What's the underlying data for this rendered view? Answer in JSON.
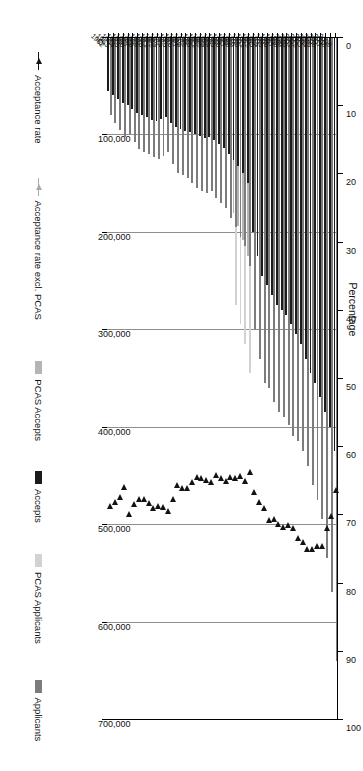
{
  "chart_data": {
    "type": "bar",
    "title": "",
    "orientation": "vertical-rotated-90",
    "xlabel": "",
    "ylabel_left": "",
    "percentage_axis_title": "Percentage",
    "count_axis_ticks": [
      "0",
      "100,000",
      "200,000",
      "300,000",
      "400,000",
      "500,000",
      "600,000",
      "700,000"
    ],
    "count_axis_values": [
      0,
      100000,
      200000,
      300000,
      400000,
      500000,
      600000,
      700000
    ],
    "count_axis_lim": [
      0,
      700000
    ],
    "percentage_axis_ticks": [
      "0",
      "10",
      "20",
      "30",
      "40",
      "50",
      "60",
      "70",
      "80",
      "90",
      "100"
    ],
    "percentage_axis_values": [
      0,
      10,
      20,
      30,
      40,
      50,
      60,
      70,
      80,
      90,
      100
    ],
    "percentage_axis_lim": [
      0,
      100
    ],
    "grid": true,
    "legend_position": "bottom",
    "categories": [
      "1962",
      "1963",
      "1964",
      "1965",
      "1966",
      "1967",
      "1968",
      "1969",
      "1970",
      "1971",
      "1972",
      "1973",
      "1974",
      "1975",
      "1976",
      "1977",
      "1978",
      "1979",
      "1980",
      "1981",
      "1982",
      "1983",
      "1984",
      "1985",
      "1986",
      "1987",
      "1988",
      "1989",
      "1990",
      "1991",
      "1992",
      "1993",
      "1994",
      "1995",
      "1996",
      "1997",
      "1998",
      "1999",
      "2000",
      "2001",
      "2002",
      "2003",
      "2004",
      "2005",
      "2006",
      "2007",
      "2008",
      "2009"
    ],
    "series": [
      {
        "name": "Applicants",
        "color": "#7c7c7c",
        "kind": "bar",
        "values": [
          80000,
          88000,
          95000,
          103000,
          100000,
          108000,
          115000,
          118000,
          120000,
          123000,
          125000,
          122000,
          118000,
          130000,
          140000,
          142000,
          145000,
          150000,
          155000,
          158000,
          160000,
          158000,
          165000,
          170000,
          175000,
          186000,
          195000,
          205000,
          215000,
          235000,
          300000,
          330000,
          355000,
          360000,
          375000,
          385000,
          390000,
          398000,
          410000,
          415000,
          425000,
          440000,
          460000,
          475000,
          495000,
          535000,
          570000,
          640000
        ]
      },
      {
        "name": "PCAS Applicants",
        "color": "#d2d2d2",
        "kind": "bar",
        "values": [
          0,
          0,
          0,
          0,
          0,
          0,
          0,
          0,
          0,
          0,
          0,
          0,
          0,
          0,
          0,
          0,
          0,
          0,
          0,
          0,
          0,
          0,
          0,
          0,
          0,
          0,
          80000,
          90000,
          100000,
          110000,
          0,
          0,
          0,
          0,
          0,
          0,
          0,
          0,
          0,
          0,
          0,
          0,
          0,
          0,
          0,
          0,
          0,
          0
        ]
      },
      {
        "name": "Accepts",
        "color": "#1b1b1b",
        "kind": "bar",
        "values": [
          55000,
          60000,
          64000,
          68000,
          70000,
          74000,
          78000,
          80000,
          82000,
          85000,
          86000,
          84000,
          82000,
          88000,
          92000,
          94000,
          96000,
          98000,
          100000,
          102000,
          104000,
          103000,
          106000,
          110000,
          114000,
          120000,
          126000,
          132000,
          140000,
          150000,
          200000,
          225000,
          245000,
          255000,
          265000,
          275000,
          280000,
          285000,
          295000,
          305000,
          315000,
          330000,
          345000,
          355000,
          370000,
          385000,
          400000,
          425000
        ]
      },
      {
        "name": "PCAS Accepts",
        "color": "#b4b4b4",
        "kind": "bar",
        "values": [
          0,
          0,
          0,
          0,
          0,
          0,
          0,
          0,
          0,
          0,
          0,
          0,
          0,
          0,
          0,
          0,
          0,
          0,
          0,
          0,
          0,
          0,
          0,
          0,
          0,
          0,
          55000,
          62000,
          68000,
          75000,
          0,
          0,
          0,
          0,
          0,
          0,
          0,
          0,
          0,
          0,
          0,
          0,
          0,
          0,
          0,
          0,
          0,
          0
        ]
      },
      {
        "name": "Acceptance rate",
        "color": "#121212",
        "kind": "marker",
        "values": [
          68.8,
          68.2,
          67.4,
          66.0,
          70.0,
          68.5,
          67.8,
          67.8,
          68.3,
          69.1,
          68.8,
          68.9,
          69.5,
          67.7,
          65.7,
          66.2,
          66.2,
          65.3,
          64.5,
          64.6,
          65.0,
          65.2,
          64.2,
          64.7,
          65.1,
          64.5,
          64.6,
          64.4,
          65.1,
          63.8,
          66.7,
          68.2,
          69.0,
          70.8,
          70.7,
          71.4,
          71.8,
          71.6,
          72.0,
          73.5,
          74.1,
          75.0,
          75.0,
          74.7,
          74.7,
          72.0,
          70.2,
          66.4
        ]
      },
      {
        "name": "Acceptance rate excl. PCAS",
        "color": "#aaaaaa",
        "kind": "marker",
        "values": [
          null,
          null,
          null,
          null,
          null,
          null,
          null,
          null,
          null,
          null,
          null,
          null,
          null,
          null,
          null,
          null,
          null,
          null,
          null,
          null,
          null,
          null,
          null,
          null,
          null,
          null,
          64.6,
          64.4,
          65.1,
          63.8,
          null,
          null,
          null,
          null,
          null,
          null,
          null,
          null,
          null,
          null,
          null,
          null,
          null,
          null,
          null,
          null,
          null,
          null
        ]
      }
    ],
    "legend_entries": [
      {
        "label": "Applicants",
        "type": "swatch",
        "color": "#7c7c7c"
      },
      {
        "label": "PCAS Applicants",
        "type": "swatch",
        "color": "#d2d2d2"
      },
      {
        "label": "Accepts",
        "type": "swatch",
        "color": "#1b1b1b"
      },
      {
        "label": "PCAS Accepts",
        "type": "swatch",
        "color": "#b4b4b4"
      },
      {
        "label": "Acceptance rate excl. PCAS",
        "type": "marker",
        "color": "#aaaaaa"
      },
      {
        "label": "Acceptance rate",
        "type": "marker",
        "color": "#121212"
      }
    ]
  }
}
